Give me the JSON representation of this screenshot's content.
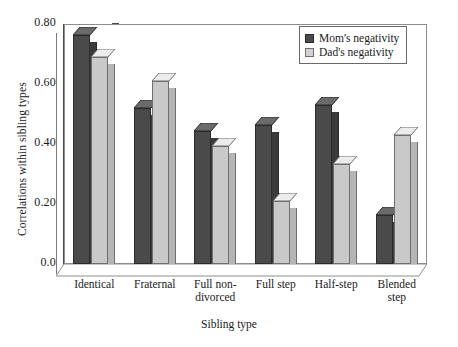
{
  "chart_data": {
    "type": "bar",
    "title": "",
    "xlabel": "Sibling type",
    "ylabel": "Correlations within sibling types",
    "categories": [
      "Identical",
      "Fraternal",
      "Full non-divorced",
      "Full step",
      "Half-step",
      "Blended step"
    ],
    "category_lines": [
      [
        "Identical"
      ],
      [
        "Fraternal"
      ],
      [
        "Full non-",
        "divorced"
      ],
      [
        "Full step"
      ],
      [
        "Half-step"
      ],
      [
        "Blended",
        "step"
      ]
    ],
    "series": [
      {
        "name": "Mom's negativity",
        "color": "#4a4a4a",
        "values": [
          0.765,
          0.52,
          0.445,
          0.465,
          0.53,
          0.165
        ]
      },
      {
        "name": "Dad's negativity",
        "color": "#d2d2d2",
        "values": [
          0.69,
          0.61,
          0.395,
          0.21,
          0.335,
          0.43
        ]
      }
    ],
    "ylim": [
      0.0,
      0.8
    ],
    "yticks": [
      0.0,
      0.2,
      0.4,
      0.6,
      0.8
    ],
    "ytick_labels": [
      "0.0",
      "0.20",
      "0.40",
      "0.60",
      "0.80"
    ],
    "grid": false,
    "legend_position": "top-right",
    "style": "3d-bars"
  },
  "legend": {
    "items": [
      {
        "label": "Mom's negativity",
        "swatch": "dark"
      },
      {
        "label": "Dad's negativity",
        "swatch": "light"
      }
    ]
  }
}
